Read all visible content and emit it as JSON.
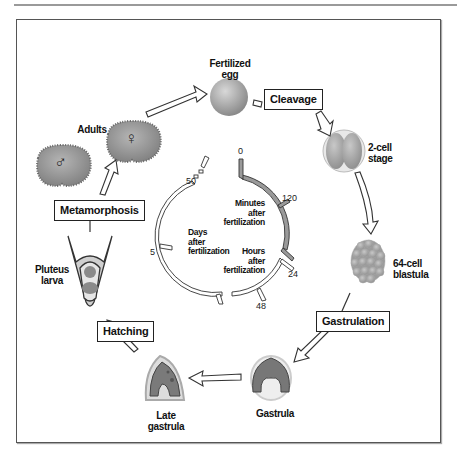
{
  "diagram": {
    "stages": {
      "fertilized_egg": "Fertilized\negg",
      "two_cell": "2-cell\nstage",
      "blastula": "64-cell\nblastula",
      "gastrula": "Gastrula",
      "late_gastrula": "Late\ngastrula",
      "pluteus": "Pluteus\nlarva",
      "adults": "Adults"
    },
    "processes": {
      "cleavage": "Cleavage",
      "gastrulation": "Gastrulation",
      "hatching": "Hatching",
      "metamorphosis": "Metamorphosis"
    },
    "symbols": {
      "male": "♂",
      "female": "♀"
    },
    "timeline": {
      "minutes_label": "Minutes\nafter\nfertilization",
      "hours_label": "Hours\nafter\nfertilization",
      "days_label": "Days\nafter\nfertilization",
      "ticks": {
        "t0": "0",
        "t120": "120",
        "t24": "24",
        "t48": "48",
        "t5": "5",
        "t50": "50"
      }
    },
    "colors": {
      "minutes_arc": "#9a9a9a",
      "other_arcs": "#ffffff",
      "outline": "#333333"
    }
  }
}
